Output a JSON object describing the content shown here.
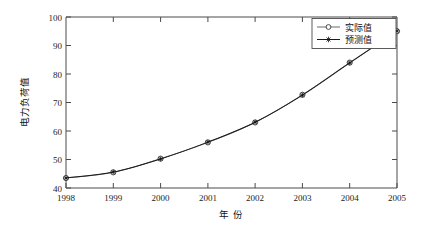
{
  "chart_data": {
    "type": "line",
    "title": "",
    "xlabel": "年  份",
    "ylabel": "电力负荷值",
    "x": [
      1998,
      1999,
      2000,
      2001,
      2002,
      2003,
      2004,
      2005
    ],
    "xticklabels": [
      "1998",
      "1999",
      "2000",
      "2001",
      "2002",
      "2003",
      "2004",
      "2005"
    ],
    "yticklabels": [
      "40",
      "50",
      "60",
      "70",
      "80",
      "90",
      "100"
    ],
    "yticks": [
      40,
      50,
      60,
      70,
      80,
      90,
      100
    ],
    "xlim": [
      1998,
      2005
    ],
    "ylim": [
      40,
      100
    ],
    "grid": false,
    "legend_position": "upper right",
    "series": [
      {
        "name": "实际值",
        "marker": "circle",
        "color": "#5a5a5a",
        "values": [
          43.5,
          45.5,
          50.3,
          56.0,
          63.0,
          72.7,
          84.0,
          95.0
        ]
      },
      {
        "name": "预测值",
        "marker": "star",
        "color": "#1b1b1b",
        "values": [
          43.5,
          45.6,
          50.2,
          56.1,
          63.1,
          72.6,
          83.9,
          95.1
        ]
      }
    ]
  },
  "axes": {
    "x_title": "年  份",
    "y_title": "电力负荷值"
  },
  "legend": {
    "entries": [
      {
        "label": "实际值"
      },
      {
        "label": "预测值"
      }
    ]
  },
  "ticks": {
    "x": [
      "1998",
      "1999",
      "2000",
      "2001",
      "2002",
      "2003",
      "2004",
      "2005"
    ],
    "y": [
      "100",
      "90",
      "80",
      "70",
      "60",
      "50",
      "40"
    ]
  }
}
